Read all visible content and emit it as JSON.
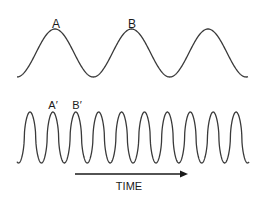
{
  "diagram": {
    "top_wave": {
      "description": "low frequency wave",
      "peak_labels": [
        "A",
        "B"
      ],
      "peaks_x": [
        55,
        131,
        208
      ],
      "color": "#3a3a3a"
    },
    "bottom_wave": {
      "description": "high frequency wave",
      "peak_labels": [
        "A′",
        "B′"
      ],
      "peak_count": 10,
      "color": "#3a3a3a"
    },
    "axis": {
      "label": "TIME",
      "direction": "right"
    }
  }
}
